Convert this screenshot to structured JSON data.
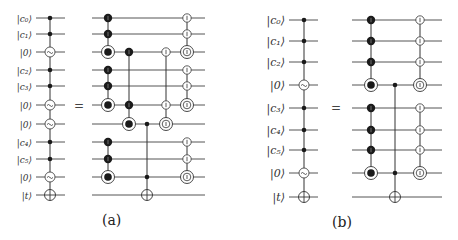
{
  "panels": [
    {
      "id": "a",
      "caption": "(a)",
      "equals": "=",
      "lhs": {
        "wire_labels": [
          "|c₀⟩",
          "|c₁⟩",
          "|0⟩",
          "|c₂⟩",
          "|c₃⟩",
          "|0⟩",
          "|0⟩",
          "|c₄⟩",
          "|c₅⟩",
          "|0⟩",
          "|t⟩"
        ],
        "wire_y": [
          18,
          34,
          52,
          70,
          86,
          105,
          124,
          142,
          159,
          177,
          195
        ],
        "gate_column": [
          "control",
          "control",
          "tilde",
          "control",
          "control",
          "tilde",
          "tilde",
          "control",
          "control",
          "tilde",
          "target"
        ]
      },
      "rhs": {
        "wire_y": [
          18,
          34,
          52,
          70,
          86,
          105,
          124,
          142,
          159,
          177,
          195
        ],
        "columns": [
          {
            "x": 108,
            "gates": {
              "0": "black-I",
              "1": "black-I",
              "2": "black-ring",
              "3": "black-I",
              "4": "black-I",
              "5": "black-ring",
              "7": "black-I",
              "8": "black-I",
              "9": "black-ring"
            },
            "segments": [
              [
                0,
                2
              ],
              [
                3,
                5
              ],
              [
                7,
                9
              ]
            ]
          },
          {
            "x": 129,
            "gates": {
              "2": "black-I",
              "5": "black-I",
              "6": "black-ring"
            },
            "segments": [
              [
                2,
                6
              ]
            ]
          },
          {
            "x": 147,
            "gates": {
              "6": "dot",
              "9": "dot",
              "10": "oplus"
            },
            "segments": [
              [
                6,
                10
              ]
            ]
          },
          {
            "x": 166,
            "gates": {
              "2": "white-I",
              "5": "white-I",
              "6": "white-ring"
            },
            "segments": [
              [
                2,
                6
              ]
            ]
          },
          {
            "x": 187,
            "gates": {
              "0": "white-I",
              "1": "white-I",
              "2": "white-ring",
              "3": "white-I",
              "4": "white-I",
              "5": "white-ring",
              "7": "white-I",
              "8": "white-I",
              "9": "white-ring"
            },
            "segments": [
              [
                0,
                2
              ],
              [
                3,
                5
              ],
              [
                7,
                9
              ]
            ]
          }
        ]
      }
    },
    {
      "id": "b",
      "caption": "(b)",
      "equals": "=",
      "lhs": {
        "wire_labels": [
          "|c₀⟩",
          "|c₁⟩",
          "|c₂⟩",
          "|0⟩",
          "|c₃⟩",
          "|c₄⟩",
          "|c₅⟩",
          "|0⟩",
          "|t⟩"
        ],
        "wire_y": [
          20,
          41,
          62,
          85,
          108,
          130,
          150,
          173,
          197
        ],
        "gate_column": [
          "control",
          "control",
          "control",
          "tilde",
          "control",
          "control",
          "control",
          "tilde",
          "target"
        ]
      },
      "rhs": {
        "wire_y": [
          20,
          41,
          62,
          85,
          108,
          130,
          150,
          173,
          197
        ],
        "columns": [
          {
            "x": 371,
            "gates": {
              "0": "black-I",
              "1": "black-I",
              "2": "black-I",
              "3": "black-ring",
              "4": "black-I",
              "5": "black-I",
              "6": "black-I",
              "7": "black-ring"
            },
            "segments": [
              [
                0,
                3
              ],
              [
                4,
                7
              ]
            ]
          },
          {
            "x": 395,
            "gates": {
              "3": "dot",
              "7": "dot",
              "8": "oplus"
            },
            "segments": [
              [
                3,
                8
              ]
            ]
          },
          {
            "x": 420,
            "gates": {
              "0": "white-I",
              "1": "white-I",
              "2": "white-I",
              "3": "white-ring",
              "4": "white-I",
              "5": "white-I",
              "6": "white-I",
              "7": "white-ring"
            },
            "segments": [
              [
                0,
                3
              ],
              [
                4,
                7
              ]
            ]
          }
        ]
      }
    }
  ],
  "colors": {
    "wire": "#555555",
    "gate_black": "#1a1a1a",
    "gate_white": "#ffffff",
    "stroke": "#333333"
  }
}
